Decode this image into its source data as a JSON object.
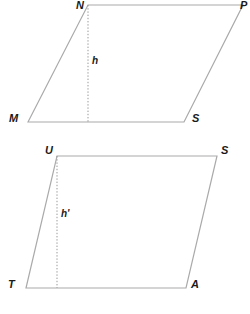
{
  "figure": {
    "stroke_color": "#aaaaaa",
    "dotted_color": "#999999",
    "label_color": "#1a1a1a",
    "background": "#ffffff",
    "shapes": [
      {
        "id": "parallelogram-top",
        "name": "MNPS",
        "vertices": [
          {
            "label": "M",
            "x": 28,
            "y": 122,
            "label_x": 9,
            "label_y": 113
          },
          {
            "label": "N",
            "x": 88,
            "y": 5,
            "label_x": 76,
            "label_y": 0
          },
          {
            "label": "P",
            "x": 243,
            "y": 5,
            "label_x": 240,
            "label_y": 0
          },
          {
            "label": "S",
            "x": 184,
            "y": 122,
            "label_x": 192,
            "label_y": 113
          }
        ],
        "height": {
          "label": "h",
          "from_x": 88,
          "from_y": 5,
          "to_x": 88,
          "to_y": 122,
          "label_x": 92,
          "label_y": 55
        }
      },
      {
        "id": "parallelogram-bottom",
        "name": "TUSA",
        "vertices": [
          {
            "label": "T",
            "x": 26,
            "y": 288,
            "label_x": 8,
            "label_y": 279
          },
          {
            "label": "U",
            "x": 57,
            "y": 156,
            "label_x": 45,
            "label_y": 145
          },
          {
            "label": "S",
            "x": 217,
            "y": 156,
            "label_x": 221,
            "label_y": 145
          },
          {
            "label": "A",
            "x": 186,
            "y": 288,
            "label_x": 191,
            "label_y": 279
          }
        ],
        "height": {
          "label": "h'",
          "from_x": 57,
          "from_y": 156,
          "to_x": 57,
          "to_y": 288,
          "label_x": 61,
          "label_y": 208
        }
      }
    ]
  }
}
